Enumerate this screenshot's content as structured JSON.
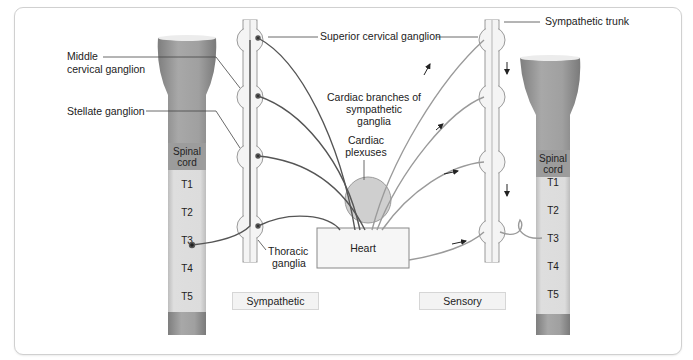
{
  "labels": {
    "middle_cervical_ganglion_1": "Middle",
    "middle_cervical_ganglion_2": "cervical ganglion",
    "stellate_ganglion": "Stellate ganglion",
    "superior_cervical_ganglion": "Superior cervical ganglion",
    "sympathetic_trunk": "Sympathetic trunk",
    "cardiac_branches_1": "Cardiac branches of",
    "cardiac_branches_2": "sympathetic",
    "cardiac_branches_3": "ganglia",
    "cardiac_plexuses_1": "Cardiac",
    "cardiac_plexuses_2": "plexuses",
    "thoracic_ganglia_1": "Thoracic",
    "thoracic_ganglia_2": "ganglia",
    "heart": "Heart"
  },
  "spinal_cord": {
    "label_1": "Spinal",
    "label_2": "cord",
    "segments": [
      "T1",
      "T2",
      "T3",
      "T4",
      "T5"
    ]
  },
  "panels": {
    "left": "Sympathetic",
    "right": "Sensory"
  },
  "colors": {
    "sympathetic_fiber": "#555555",
    "sensory_fiber": "#9a9a9a",
    "cord_dark": "#8f8f8f",
    "cord_light": "#d9d9d9",
    "plexus": "#cfcfcf"
  }
}
